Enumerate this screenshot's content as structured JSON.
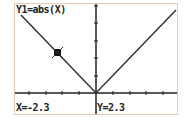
{
  "screen": {
    "equation": "Y1=abs(X)",
    "trace_x": "X=-2.3",
    "trace_y": "Y=2.3",
    "colors": {
      "border": "#e8c9b0",
      "ink": "#222222",
      "background": "#ffffff"
    }
  }
}
